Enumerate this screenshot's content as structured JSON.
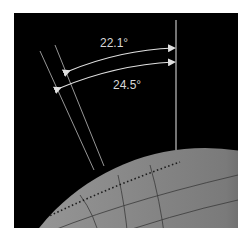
{
  "diagram": {
    "labels": {
      "min_tilt": "22.1°",
      "max_tilt": "24.5°"
    },
    "colors": {
      "background": "#000000",
      "lines": "#d0d0d0",
      "globe_light": "#9a9a9a",
      "globe_dark": "#0a0a0a"
    }
  }
}
